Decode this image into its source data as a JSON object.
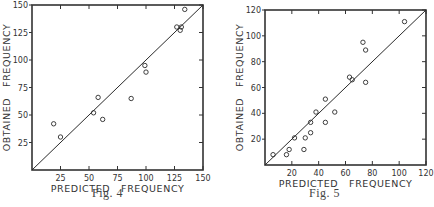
{
  "chart_data": [
    {
      "type": "scatter",
      "title": "",
      "caption": "Fig. 4",
      "xlabel": "PREDICTED   FREQUENCY",
      "ylabel": "OBTAINED   FREQUENCY",
      "xlim": [
        0,
        150
      ],
      "ylim": [
        0,
        150
      ],
      "xticks": [
        25,
        50,
        75,
        100,
        125,
        150
      ],
      "yticks": [
        25,
        50,
        75,
        100,
        125,
        150
      ],
      "grid": false,
      "legend": null,
      "reference_line": {
        "from": [
          0,
          0
        ],
        "to": [
          150,
          150
        ],
        "label": "y = x"
      },
      "series": [
        {
          "name": "observations",
          "marker": "open-circle",
          "points": [
            [
              19,
              42
            ],
            [
              25,
              30
            ],
            [
              54,
              52
            ],
            [
              58,
              66
            ],
            [
              62,
              46
            ],
            [
              87,
              65
            ],
            [
              99,
              95
            ],
            [
              100,
              89
            ],
            [
              127,
              130
            ],
            [
              130,
              127
            ],
            [
              131,
              130
            ],
            [
              134,
              146
            ]
          ]
        }
      ]
    },
    {
      "type": "scatter",
      "title": "",
      "caption": "Fig. 5",
      "xlabel": "PREDICTED   FREQUENCY",
      "ylabel": "OBTAINED   FREQUENCY",
      "xlim": [
        0,
        120
      ],
      "ylim": [
        0,
        120
      ],
      "xticks": [
        20,
        40,
        60,
        80,
        100,
        120
      ],
      "yticks": [
        20,
        40,
        60,
        80,
        100,
        120
      ],
      "grid": false,
      "legend": null,
      "reference_line": {
        "from": [
          0,
          0
        ],
        "to": [
          120,
          120
        ],
        "label": "y = x"
      },
      "series": [
        {
          "name": "observations",
          "marker": "open-circle",
          "points": [
            [
              6,
              8
            ],
            [
              16,
              8
            ],
            [
              18,
              12
            ],
            [
              22,
              21
            ],
            [
              29,
              12
            ],
            [
              30,
              21
            ],
            [
              34,
              25
            ],
            [
              34,
              33
            ],
            [
              38,
              41
            ],
            [
              45,
              33
            ],
            [
              45,
              51
            ],
            [
              52,
              41
            ],
            [
              63,
              68
            ],
            [
              65,
              66
            ],
            [
              73,
              95
            ],
            [
              75,
              64
            ],
            [
              75,
              89
            ],
            [
              104,
              111
            ]
          ]
        }
      ]
    }
  ],
  "figures": [
    {
      "caption": "Fig. 4",
      "xlabel": "PREDICTED   FREQUENCY",
      "ylabel": "OBTAINED   FREQUENCY"
    },
    {
      "caption": "Fig. 5",
      "xlabel": "PREDICTED   FREQUENCY",
      "ylabel": "OBTAINED   FREQUENCY"
    }
  ],
  "style": {
    "ink": "#2a2a2a",
    "frame": "#333333",
    "background": "#ffffff"
  }
}
